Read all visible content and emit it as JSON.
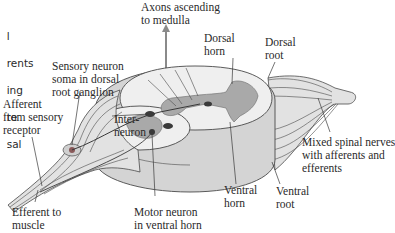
{
  "diagram": {
    "cropped_left_text": [
      "l",
      "rents",
      "ing",
      "te",
      "sal"
    ],
    "labels": {
      "axons_ascending": "Axons ascending\nto medulla",
      "dorsal_horn": "Dorsal\nhorn",
      "dorsal_root": "Dorsal\nroot",
      "sensory_neuron": "Sensory neuron\nsoma in dorsal\nroot ganglion",
      "afferent": "Afferent\nfrom sensory\nreceptor",
      "interneuron": "Inter-\nneuron",
      "mixed_nerves": "Mixed spinal nerves\nwith afferents and\nefferents",
      "ventral_horn": "Ventral\nhorn",
      "ventral_root": "Ventral\nroot",
      "efferent": "Efferent to\nmuscle",
      "motor_neuron": "Motor neuron\nin ventral horn"
    },
    "colors": {
      "white_matter": "#efefef",
      "gray_matter": "#a9a9a9",
      "cord_side": "#d4d4d4",
      "nerve_fill": "#e2e2e2",
      "outline": "#4a4a4a",
      "neuron": "#3a3a3a",
      "arrow": "#8a8a8a"
    }
  }
}
